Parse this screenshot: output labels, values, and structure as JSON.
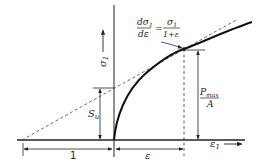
{
  "diagram": {
    "y_axis_label": "σ",
    "y_axis_sub": "1",
    "x_axis_label": "ε",
    "x_axis_sub": "1",
    "equation": {
      "lhs_num": "dσ",
      "lhs_num_sub": "1",
      "lhs_den": "dε",
      "equals": "=",
      "rhs_num": "σ",
      "rhs_num_sub": "1",
      "rhs_den": "1+ε"
    },
    "su_label": "S",
    "su_sub": "u",
    "pmax_num": "P",
    "pmax_sub": "max",
    "pmax_den": "A",
    "dim_one": "1",
    "dim_eps": "ε"
  }
}
